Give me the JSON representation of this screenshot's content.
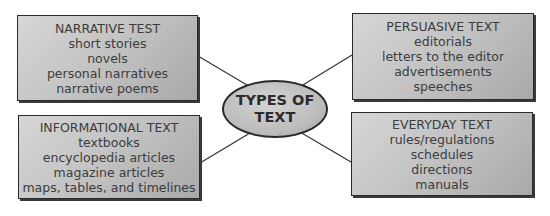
{
  "center": {
    "line1": "TYPES OF",
    "line2": "TEXT"
  },
  "boxes": {
    "narrative": {
      "title": "NARRATIVE TEST",
      "items": [
        "short stories",
        "novels",
        "personal narratives",
        "narrative poems"
      ]
    },
    "persuasive": {
      "title": "PERSUASIVE TEXT",
      "items": [
        "editorials",
        "letters to the editor",
        "advertisements",
        "speeches"
      ]
    },
    "informational": {
      "title": "INFORMATIONAL TEXT",
      "items": [
        "textbooks",
        "encyclopedia articles",
        "magazine articles",
        "maps, tables, and timelines"
      ]
    },
    "everyday": {
      "title": "EVERYDAY TEXT",
      "items": [
        "rules/regulations",
        "schedules",
        "directions",
        "manuals"
      ]
    }
  }
}
